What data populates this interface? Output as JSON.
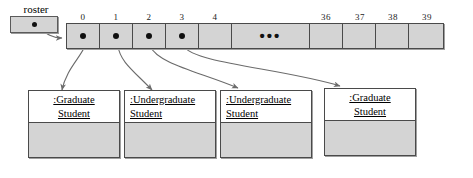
{
  "diagram": {
    "type": "uml-object-diagram",
    "colors": {
      "fill": "#d4d4d4",
      "stroke": "#4a4a4a",
      "header_fill": "#ffffff",
      "dot": "#101010",
      "arrow": "#6b6b6b",
      "background": "#ffffff"
    }
  },
  "variable": {
    "label": "roster",
    "dot_icon": "reference-dot-icon"
  },
  "array": {
    "indices": [
      "0",
      "1",
      "2",
      "3",
      "4",
      "36",
      "37",
      "38",
      "39"
    ],
    "ellipsis": "•••",
    "cells": [
      {
        "index": "0",
        "has_reference": true
      },
      {
        "index": "1",
        "has_reference": true
      },
      {
        "index": "2",
        "has_reference": true
      },
      {
        "index": "3",
        "has_reference": true
      },
      {
        "index": "4",
        "has_reference": false
      },
      {
        "index": "",
        "has_reference": false,
        "ellipsis": true
      },
      {
        "index": "36",
        "has_reference": false
      },
      {
        "index": "37",
        "has_reference": false
      },
      {
        "index": "38",
        "has_reference": false
      },
      {
        "index": "39",
        "has_reference": false
      }
    ]
  },
  "objects": [
    {
      "name": ":Graduate\nStudent",
      "align": "center",
      "from_cell": "0"
    },
    {
      "name": ":Undergraduate\nStudent",
      "align": "left",
      "from_cell": "1"
    },
    {
      "name": ":Undergraduate\nStudent",
      "align": "left",
      "from_cell": "2"
    },
    {
      "name": ":Graduate\nStudent",
      "align": "center",
      "from_cell": "3"
    }
  ]
}
